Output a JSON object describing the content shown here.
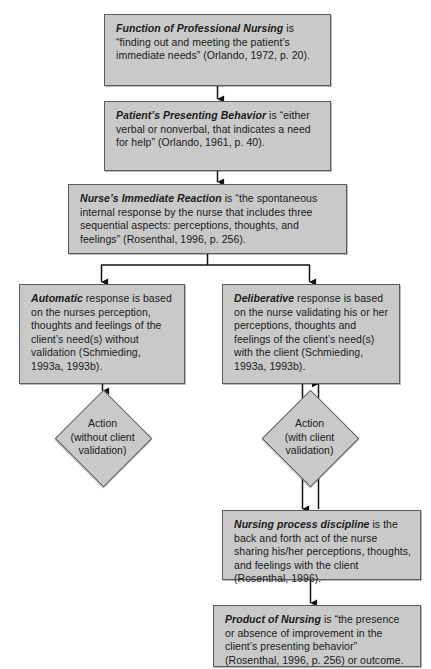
{
  "diagram": {
    "background_color": "#ffffff",
    "node_fill": "#c9c9c9",
    "node_border": "#5c5c5c",
    "connector_color": "#111111"
  },
  "nodes": {
    "function": {
      "term": "Function of Professional Nursing",
      "body": " is “finding out and meeting the patient’s immediate needs” (Orlando, 1972, p. 20)."
    },
    "behavior": {
      "term": "Patient’s Presenting Behavior",
      "body": " is “either verbal or nonverbal, that indicates a need for help” (Orlando, 1961, p. 40)."
    },
    "reaction": {
      "term": "Nurse’s Immediate Reaction",
      "body": " is “the spontaneous internal response by the nurse that includes three sequential aspects: perceptions, thoughts, and feelings” (Rosenthal, 1996, p. 256)."
    },
    "automatic": {
      "term": "Automatic",
      "body": " response is based on the nurses perception, thoughts and feelings of the client’s need(s) without validation (Schmieding, 1993a, 1993b)."
    },
    "deliberative": {
      "term": "Deliberative",
      "body": " response is based on the nurse validating his or her perceptions, thoughts and feelings of the client’s need(s) with the client (Schmieding, 1993a, 1993b)."
    },
    "discipline": {
      "term": "Nursing process discipline",
      "body": " is the back and forth act of the nurse sharing his/her perceptions, thoughts, and feelings with the client (Rosenthal, 1996)."
    },
    "product": {
      "term": "Product of Nursing",
      "body": " is “the presence or absence of improvement in the client’s presenting behavior” (Rosenthal, 1996, p. 256) or outcome."
    }
  },
  "decisions": {
    "action_without_validation": "Action\n(without client\nvalidation)",
    "action_with_validation": "Action\n(with client\nvalidation)"
  },
  "connectors": [
    {
      "name": "function-to-behavior",
      "type": "arrow-down"
    },
    {
      "name": "behavior-to-reaction",
      "type": "arrow-down"
    },
    {
      "name": "reaction-split",
      "type": "split-two-arrows-down"
    },
    {
      "name": "automatic-to-action",
      "type": "arrow-down"
    },
    {
      "name": "deliberative-to-action-with",
      "type": "arrow-down"
    },
    {
      "name": "action-with-to-deliberative",
      "type": "arrow-up"
    },
    {
      "name": "action-with-to-discipline",
      "type": "arrow-down"
    },
    {
      "name": "discipline-to-action-with",
      "type": "arrow-up"
    },
    {
      "name": "discipline-to-product",
      "type": "arrow-down"
    }
  ]
}
